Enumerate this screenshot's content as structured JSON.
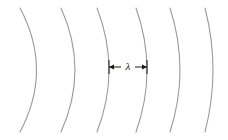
{
  "figure": {
    "width": 228,
    "height": 140,
    "background_color": "#ffffff"
  },
  "style": {
    "arc_color": "#9a9a9a",
    "arc_stroke_width": 1.1,
    "annotation_color": "#1a1a1a",
    "annotation_stroke_width": 1.0,
    "label_color": "#111111",
    "label_font_size": 11
  },
  "chart_data": {
    "type": "line",
    "xlabel": "",
    "ylabel": "",
    "xlim": [
      0,
      228
    ],
    "ylim": [
      0,
      140
    ],
    "grid": false,
    "legend": null,
    "series": [
      {
        "name": "wavefront-1",
        "index": 1,
        "top_x": 20,
        "mid_x": 37,
        "bottom_x": 20,
        "top_y": 8,
        "mid_y": 70,
        "bottom_y": 132,
        "sagitta": 17,
        "path": "M 20 8 Q 53 70 20 132"
      },
      {
        "name": "wavefront-2",
        "index": 2,
        "top_x": 61,
        "mid_x": 75,
        "bottom_x": 61,
        "top_y": 8,
        "mid_y": 70,
        "bottom_y": 132,
        "sagitta": 14,
        "path": "M 61 8 Q 89 70 61 132"
      },
      {
        "name": "wavefront-3",
        "index": 3,
        "top_x": 97,
        "mid_x": 109,
        "bottom_x": 97,
        "top_y": 8,
        "mid_y": 70,
        "bottom_y": 132,
        "sagitta": 12,
        "path": "M 97 8 Q 121 70 97 132"
      },
      {
        "name": "wavefront-4",
        "index": 4,
        "top_x": 136,
        "mid_x": 147,
        "bottom_x": 136,
        "top_y": 8,
        "mid_y": 70,
        "bottom_y": 132,
        "sagitta": 11,
        "path": "M 136 8 Q 158 70 136 132"
      },
      {
        "name": "wavefront-5",
        "index": 5,
        "top_x": 170,
        "mid_x": 180,
        "bottom_x": 170,
        "top_y": 8,
        "mid_y": 70,
        "bottom_y": 132,
        "sagitta": 10,
        "path": "M 170 8 Q 190 70 170 132"
      },
      {
        "name": "wavefront-6",
        "index": 6,
        "top_x": 205,
        "mid_x": 213,
        "bottom_x": 205,
        "top_y": 8,
        "mid_y": 70,
        "bottom_y": 132,
        "sagitta": 8,
        "path": "M 205 8 Q 221 70 205 132"
      }
    ]
  },
  "annotation": {
    "name": "wavelength-measure",
    "symbol": "λ",
    "symbol_name": "lambda",
    "measure_y": 67,
    "left_x": 109,
    "right_x": 147,
    "cap_half_height": 7,
    "arrow_head_length": 5,
    "arrow_head_half_width": 2.6,
    "label_x": 128,
    "label_y": 67,
    "gap_half_width": 7
  }
}
